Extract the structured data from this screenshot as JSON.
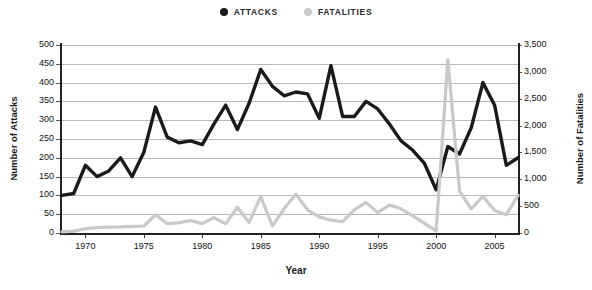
{
  "legend": {
    "items": [
      {
        "label": "ATTACKS",
        "color": "#1a1a1a",
        "icon": "filled-circle"
      },
      {
        "label": "FATALITIES",
        "color": "#c9c9c9",
        "icon": "filled-circle"
      }
    ]
  },
  "axes": {
    "x_title": "Year",
    "y_left_title": "Number of Attacks",
    "y_right_title": "Number of Fatalities",
    "y_left_ticks": [
      "0",
      "50",
      "100",
      "150",
      "200",
      "250",
      "300",
      "350",
      "400",
      "450",
      "500"
    ],
    "y_right_ticks": [
      "0",
      "500",
      "1,000",
      "1,500",
      "2,000",
      "2,500",
      "3,000",
      "3,500"
    ],
    "x_ticks": [
      "1970",
      "1975",
      "1980",
      "1985",
      "1990",
      "1995",
      "2000",
      "2005"
    ]
  },
  "chart_data": {
    "type": "line",
    "title": "",
    "subtitle": "",
    "xlabel": "Year",
    "ylabel": "Number of Attacks",
    "ylabel_secondary": "Number of Fatalities",
    "xlim": [
      1968,
      2007
    ],
    "ylim": [
      0,
      500
    ],
    "ylim_secondary": [
      0,
      3500
    ],
    "grid": true,
    "legend_position": "top-center",
    "x": [
      1968,
      1969,
      1970,
      1971,
      1972,
      1973,
      1974,
      1975,
      1976,
      1977,
      1978,
      1979,
      1980,
      1981,
      1982,
      1983,
      1984,
      1985,
      1986,
      1987,
      1988,
      1989,
      1990,
      1991,
      1992,
      1993,
      1994,
      1995,
      1996,
      1997,
      1998,
      1999,
      2000,
      2001,
      2002,
      2003,
      2004,
      2005,
      2006,
      2007
    ],
    "series": [
      {
        "name": "ATTACKS",
        "axis": "left",
        "color": "#1a1a1a",
        "values": [
          100,
          105,
          180,
          150,
          165,
          200,
          150,
          215,
          335,
          255,
          240,
          245,
          235,
          290,
          340,
          275,
          345,
          435,
          390,
          365,
          375,
          370,
          305,
          445,
          310,
          310,
          350,
          330,
          290,
          245,
          220,
          185,
          115,
          230,
          210,
          280,
          400,
          340,
          180,
          200
        ]
      },
      {
        "name": "FATALITIES",
        "axis": "right",
        "color": "#c9c9c9",
        "values": [
          20,
          35,
          80,
          100,
          110,
          115,
          125,
          130,
          340,
          175,
          190,
          230,
          175,
          285,
          170,
          480,
          195,
          680,
          130,
          455,
          720,
          430,
          300,
          240,
          210,
          430,
          570,
          380,
          520,
          450,
          320,
          180,
          40,
          3230,
          780,
          450,
          680,
          420,
          340,
          700
        ]
      }
    ]
  }
}
